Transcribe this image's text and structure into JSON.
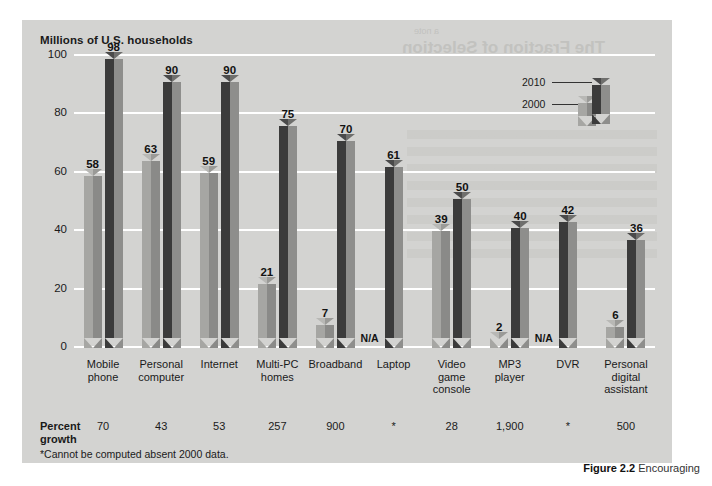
{
  "figure": {
    "axis_title": "Millions of U.S. households",
    "footnote": "*Cannot be computed absent 2000 data.",
    "growth_label_line1": "Percent",
    "growth_label_line2": "growth",
    "caption_number": "Figure 2.2",
    "caption_text": "Encouraging",
    "bleed_text_1": "The Fraction of Selection",
    "bleed_text_2": "a note"
  },
  "legend": {
    "items": [
      {
        "label": "2010",
        "color": "#3b3b3b"
      },
      {
        "label": "2000",
        "color": "#a6a6a3"
      }
    ]
  },
  "colors": {
    "panel_background": "#d3d3d1",
    "gridline": "#ffffff",
    "bar_2010_front": "#3b3b3b",
    "bar_2010_side": "#8e8e8c",
    "bar_2000_front": "#a6a6a3",
    "bar_2000_side": "#8a8a88",
    "text": "#1a1a1a"
  },
  "chart_data": {
    "type": "bar",
    "title": "Millions of U.S. households",
    "xlabel": "",
    "ylabel": "Millions of U.S. households",
    "ylim": [
      0,
      100
    ],
    "yticks": [
      0,
      20,
      40,
      60,
      80,
      100
    ],
    "grid": true,
    "legend_position": "top-right",
    "categories": [
      "Mobile phone",
      "Personal computer",
      "Internet",
      "Multi-PC homes",
      "Broadband",
      "Laptop",
      "Video game console",
      "MP3 player",
      "DVR",
      "Personal digital assistant"
    ],
    "category_lines": [
      [
        "Mobile",
        "phone"
      ],
      [
        "Personal",
        "computer"
      ],
      [
        "Internet"
      ],
      [
        "Multi-PC",
        "homes"
      ],
      [
        "Broadband"
      ],
      [
        "Laptop"
      ],
      [
        "Video game",
        "console"
      ],
      [
        "MP3",
        "player"
      ],
      [
        "DVR"
      ],
      [
        "Personal",
        "digital",
        "assistant"
      ]
    ],
    "series": [
      {
        "name": "2000",
        "values": [
          58,
          63,
          59,
          21,
          7,
          null,
          39,
          2,
          null,
          6
        ],
        "labels": [
          "58",
          "63",
          "59",
          "21",
          "7",
          "N/A",
          "39",
          "2",
          "N/A",
          "6"
        ]
      },
      {
        "name": "2010",
        "values": [
          98,
          90,
          90,
          75,
          70,
          61,
          50,
          40,
          42,
          36
        ],
        "labels": [
          "98",
          "90",
          "90",
          "75",
          "70",
          "61",
          "50",
          "40",
          "42",
          "36"
        ]
      }
    ],
    "percent_growth": [
      "70",
      "43",
      "53",
      "257",
      "900",
      "*",
      "28",
      "1,900",
      "*",
      "500"
    ]
  }
}
